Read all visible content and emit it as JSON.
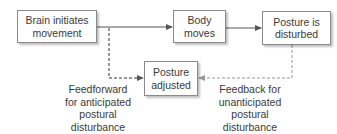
{
  "nodes": {
    "brain": "Brain initiates\nmovement",
    "body": "Body\nmoves",
    "disturbed": "Posture is\ndisturbed",
    "adjusted": "Posture\nadjusted"
  },
  "labels": {
    "feedforward": "Feedforward\nfor anticipated\npostural\ndisturbance",
    "feedback": "Feedback for\nunanticipated\npostural\ndisturbance"
  }
}
